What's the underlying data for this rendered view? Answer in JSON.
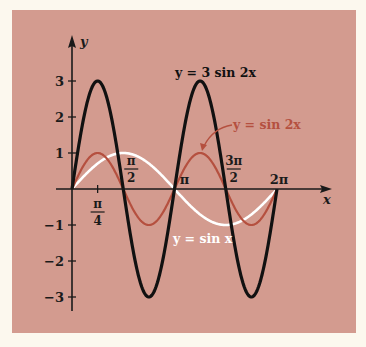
{
  "chart_data": {
    "type": "line",
    "title": "",
    "xlabel": "x",
    "ylabel": "y",
    "xlim": [
      0,
      6.2832
    ],
    "ylim": [
      -3,
      3
    ],
    "grid": false,
    "x_ticks": [
      {
        "value": 0.7854,
        "label": "π/4",
        "num": "π",
        "den": "4"
      },
      {
        "value": 1.5708,
        "label": "π/2",
        "num": "π",
        "den": "2"
      },
      {
        "value": 3.1416,
        "label": "π"
      },
      {
        "value": 4.7124,
        "label": "3π/2",
        "num": "3π",
        "den": "2"
      },
      {
        "value": 6.2832,
        "label": "2π"
      }
    ],
    "y_ticks": [
      {
        "value": 3,
        "label": "3"
      },
      {
        "value": 2,
        "label": "2"
      },
      {
        "value": 1,
        "label": "1"
      },
      {
        "value": -1,
        "label": "−1"
      },
      {
        "value": -2,
        "label": "−2"
      },
      {
        "value": -3,
        "label": "−3"
      }
    ],
    "series": [
      {
        "name": "y = 3 sin 2x",
        "amplitude": 3,
        "frequency": 2,
        "color": "#111111",
        "x": [
          0,
          0.7854,
          1.5708,
          2.3562,
          3.1416,
          3.927,
          4.7124,
          5.4978,
          6.2832
        ],
        "values": [
          0,
          3,
          0,
          -3,
          0,
          3,
          0,
          -3,
          0
        ]
      },
      {
        "name": "y = sin 2x",
        "amplitude": 1,
        "frequency": 2,
        "color": "#b5503f",
        "x": [
          0,
          0.7854,
          1.5708,
          2.3562,
          3.1416,
          3.927,
          4.7124,
          5.4978,
          6.2832
        ],
        "values": [
          0,
          1,
          0,
          -1,
          0,
          1,
          0,
          -1,
          0
        ]
      },
      {
        "name": "y = sin x",
        "amplitude": 1,
        "frequency": 1,
        "color": "#ffffff",
        "x": [
          0,
          1.5708,
          3.1416,
          4.7124,
          6.2832
        ],
        "values": [
          0,
          1,
          0,
          -1,
          0
        ]
      }
    ],
    "annotations": [
      {
        "text": "y = 3 sin 2x",
        "color": "#111111"
      },
      {
        "text": "y = sin 2x",
        "color": "#b5503f",
        "arrow": true
      },
      {
        "text": "y = sin x",
        "color": "#ffffff"
      }
    ]
  },
  "labels": {
    "y_axis": "y",
    "x_axis": "x",
    "curve_3sin2x": "y = 3 sin 2x",
    "curve_sin2x": "y = sin 2x",
    "curve_sinx": "y = sin x"
  }
}
